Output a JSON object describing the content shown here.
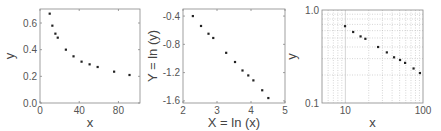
{
  "chart_data": [
    {
      "type": "scatter",
      "title": "",
      "xlabel": "x",
      "ylabel": "y",
      "xlim": [
        0,
        102
      ],
      "ylim": [
        0,
        0.705
      ],
      "xticks": [
        0,
        40,
        80
      ],
      "xtick_labels": [
        "0",
        "40",
        "80"
      ],
      "yticks": [
        0.0,
        0.2,
        0.4,
        0.6
      ],
      "ytick_labels": [
        "0.0",
        "0.2",
        "0.4",
        "0.6"
      ],
      "grid": false,
      "x": [
        9.9,
        12.6,
        15.7,
        18.1,
        26.4,
        34.2,
        42.4,
        50.6,
        58.8,
        75.6,
        91.3
      ],
      "y": [
        0.67,
        0.58,
        0.52,
        0.49,
        0.4,
        0.35,
        0.31,
        0.29,
        0.27,
        0.235,
        0.21
      ]
    },
    {
      "type": "scatter",
      "title": "",
      "xlabel": "X = ln (x)",
      "ylabel": "Y = ln (y)",
      "xlim": [
        2,
        5
      ],
      "ylim": [
        -1.63,
        -0.3
      ],
      "xticks": [
        2,
        3,
        4,
        5
      ],
      "xtick_labels": [
        "2",
        "3",
        "4",
        "5"
      ],
      "yticks": [
        -0.4,
        -0.8,
        -1.2,
        -1.6
      ],
      "ytick_labels": [
        "-0.4",
        "-0.8",
        "-1.2",
        "-1.6"
      ],
      "grid": false,
      "x": [
        2.29,
        2.53,
        2.75,
        2.89,
        3.27,
        3.53,
        3.75,
        3.92,
        4.07,
        4.33,
        4.51
      ],
      "y": [
        -0.4,
        -0.54,
        -0.65,
        -0.71,
        -0.92,
        -1.05,
        -1.17,
        -1.24,
        -1.31,
        -1.45,
        -1.56
      ]
    },
    {
      "type": "scatter",
      "title": "",
      "xlabel": "x",
      "ylabel": "y",
      "xscale": "log",
      "yscale": "log",
      "xlim": [
        5,
        100
      ],
      "ylim": [
        0.1,
        1.0
      ],
      "xticks": [
        10,
        100
      ],
      "xtick_labels": [
        "10",
        "100"
      ],
      "yticks": [
        0.1,
        1.0
      ],
      "ytick_labels": [
        "0.1",
        "1.0"
      ],
      "grid": true,
      "x": [
        9.9,
        12.6,
        15.7,
        18.1,
        26.4,
        34.2,
        42.4,
        50.6,
        58.8,
        75.6,
        91.3
      ],
      "y": [
        0.67,
        0.58,
        0.52,
        0.49,
        0.4,
        0.35,
        0.31,
        0.29,
        0.27,
        0.235,
        0.21
      ]
    }
  ],
  "colors": {
    "frame": "#888888",
    "points": "#222222",
    "grid": "#bbbbbb",
    "text": "#555555"
  }
}
